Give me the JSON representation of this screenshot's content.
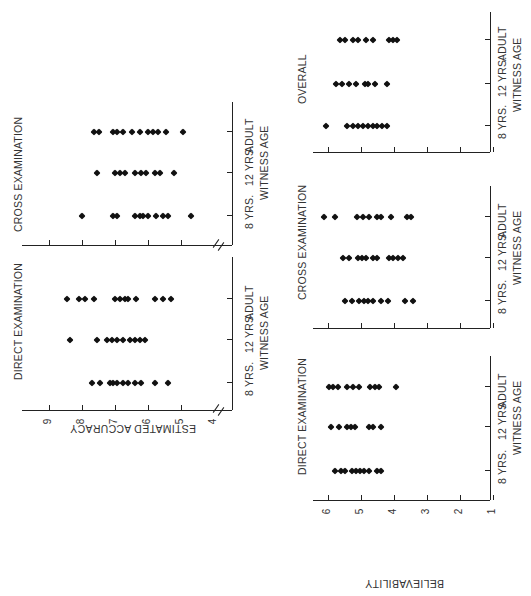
{
  "header_fragment": "",
  "chart_data": [
    {
      "type": "scatter",
      "title": "DIRECT EXAMINATION",
      "ylabel": "ESTIMATED ACCURACY",
      "xlabel": "WITNESS AGE",
      "categories": [
        "8 YRS.",
        "12 YRS.",
        "ADULT"
      ],
      "yticks": [
        4,
        5,
        6,
        7,
        8,
        9
      ],
      "ylim": [
        4,
        9.6
      ],
      "series": [
        {
          "name": "8 YRS.",
          "values": [
            7.7,
            7.45,
            7.15,
            7.05,
            6.95,
            6.75,
            6.6,
            6.4,
            6.2,
            5.8,
            5.4
          ]
        },
        {
          "name": "12 YRS.",
          "values": [
            8.35,
            7.55,
            7.25,
            7.1,
            6.95,
            6.75,
            6.55,
            6.4,
            6.25,
            6.1
          ]
        },
        {
          "name": "ADULT",
          "values": [
            8.45,
            8.1,
            7.9,
            7.65,
            7.0,
            6.85,
            6.7,
            6.6,
            6.35,
            5.8,
            5.55,
            5.3
          ]
        }
      ]
    },
    {
      "type": "scatter",
      "title": "CROSS EXAMINATION",
      "ylabel": "ESTIMATED ACCURACY",
      "xlabel": "WITNESS AGE",
      "categories": [
        "8 YRS.",
        "12 YRS.",
        "ADULT"
      ],
      "yticks": [
        4,
        5,
        6,
        7,
        8,
        9
      ],
      "ylim": [
        4,
        9.6
      ],
      "series": [
        {
          "name": "8 YRS.",
          "values": [
            8.0,
            7.05,
            6.95,
            6.4,
            6.25,
            6.15,
            6.0,
            5.75,
            5.55,
            5.4,
            4.7
          ]
        },
        {
          "name": "12 YRS.",
          "values": [
            7.55,
            7.0,
            6.85,
            6.7,
            6.4,
            6.2,
            6.05,
            5.8,
            5.65,
            5.2
          ]
        },
        {
          "name": "ADULT",
          "values": [
            7.65,
            7.5,
            7.05,
            6.95,
            6.75,
            6.5,
            6.25,
            6.0,
            5.85,
            5.7,
            5.45,
            4.95
          ]
        }
      ]
    },
    {
      "type": "scatter",
      "title": "DIRECT EXAMINATION",
      "ylabel": "BELIEVABILITY",
      "xlabel": "WITNESS AGE",
      "categories": [
        "8 YRS.",
        "12 YRS.",
        "ADULT"
      ],
      "yticks": [
        1,
        2,
        3,
        4,
        5,
        6
      ],
      "ylim": [
        1,
        6.4
      ],
      "series": [
        {
          "name": "8 YRS.",
          "values": [
            5.77,
            5.61,
            5.47,
            5.27,
            5.15,
            5.03,
            4.89,
            4.76,
            4.5,
            4.38
          ]
        },
        {
          "name": "12 YRS.",
          "values": [
            5.89,
            5.65,
            5.43,
            5.31,
            5.18,
            4.76,
            4.64,
            4.38
          ]
        },
        {
          "name": "ADULT",
          "values": [
            5.95,
            5.83,
            5.69,
            5.43,
            5.23,
            5.06,
            4.72,
            4.58,
            4.44,
            3.94
          ]
        }
      ]
    },
    {
      "type": "scatter",
      "title": "CROSS EXAMINATION",
      "ylabel": "BELIEVABILITY",
      "xlabel": "WITNESS AGE",
      "categories": [
        "8 YRS.",
        "12 YRS.",
        "ADULT"
      ],
      "yticks": [
        1,
        2,
        3,
        4,
        5,
        6
      ],
      "ylim": [
        1,
        6.4
      ],
      "series": [
        {
          "name": "8 YRS.",
          "values": [
            5.47,
            5.27,
            5.06,
            4.9,
            4.78,
            4.64,
            4.4,
            4.18,
            3.67,
            3.43
          ]
        },
        {
          "name": "12 YRS.",
          "values": [
            5.55,
            5.35,
            5.08,
            4.96,
            4.84,
            4.62,
            4.5,
            4.16,
            4.02,
            3.88,
            3.74
          ]
        },
        {
          "name": "ADULT",
          "values": [
            6.11,
            5.79,
            5.11,
            4.92,
            4.74,
            4.52,
            4.4,
            4.08,
            3.61,
            3.47
          ]
        }
      ]
    },
    {
      "type": "scatter",
      "title": "OVERALL",
      "ylabel": "BELIEVABILITY",
      "xlabel": "WITNESS AGE",
      "categories": [
        "8 YRS.",
        "12 YRS.",
        "ADULT"
      ],
      "yticks": [
        1,
        2,
        3,
        4,
        5,
        6
      ],
      "ylim": [
        1,
        6.4
      ],
      "series": [
        {
          "name": "8 YRS.",
          "values": [
            6.05,
            5.41,
            5.23,
            5.08,
            4.94,
            4.78,
            4.64,
            4.5,
            4.36,
            4.22
          ]
        },
        {
          "name": "12 YRS.",
          "values": [
            5.75,
            5.57,
            5.37,
            5.15,
            4.86,
            4.78,
            4.56,
            4.22
          ]
        },
        {
          "name": "ADULT",
          "values": [
            5.63,
            5.49,
            5.23,
            5.09,
            4.84,
            4.62,
            4.16,
            4.02,
            3.92
          ]
        }
      ]
    }
  ],
  "labels": {
    "acc_direct_title": "DIRECT EXAMINATION",
    "acc_cross_title": "CROSS EXAMINATION",
    "bel_direct_title": "DIRECT EXAMINATION",
    "bel_cross_title": "CROSS EXAMINATION",
    "bel_overall_title": "OVERALL",
    "witness_age": "WITNESS AGE",
    "cat_8": "8 YRS.",
    "cat_12": "12 YRS.",
    "cat_adult": "ADULT",
    "acc_ylabel": "ESTIMATED ACCURACY",
    "bel_ylabel": "BELIEVABILITY",
    "acc_ticks": [
      "9",
      "8",
      "7",
      "6",
      "5",
      "4"
    ],
    "bel_ticks": [
      "6",
      "5",
      "4",
      "3",
      "2",
      "1"
    ]
  }
}
